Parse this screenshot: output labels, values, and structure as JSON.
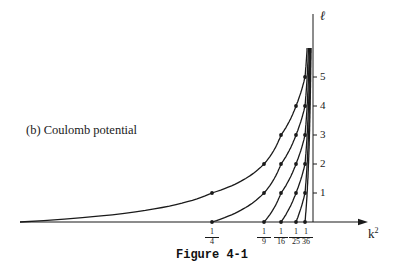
{
  "chart_data": {
    "type": "line",
    "title": "(b) Coulomb potential",
    "caption": "Figure 4-1",
    "xlabel": "k²",
    "ylabel": "ℓ",
    "x_tick_labels": [
      {
        "num": "1",
        "den": "4",
        "value": 0.25
      },
      {
        "num": "1",
        "den": "9",
        "value": 0.1111
      },
      {
        "num": "1",
        "den": "16",
        "value": 0.0625
      },
      {
        "num": "1",
        "den": "25",
        "value": 0.04
      },
      {
        "num": "1",
        "den": "36",
        "value": 0.0278
      }
    ],
    "y_tick_labels": [
      "1",
      "2",
      "3",
      "4",
      "5"
    ],
    "ylim": [
      0,
      6.5
    ],
    "grid": false,
    "note": "Each curve is a constant radial quantum number n_r; points satisfy k² = 1/(n_r + ℓ + 1)². The x-axis is drawn decreasing in k² toward the vertical ℓ axis at k² = 0.",
    "series": [
      {
        "name": "n_r = 0",
        "points": [
          {
            "k2": 0.25,
            "l": 1
          },
          {
            "k2": 0.1111,
            "l": 2
          },
          {
            "k2": 0.0625,
            "l": 3
          },
          {
            "k2": 0.04,
            "l": 4
          },
          {
            "k2": 0.0278,
            "l": 5
          }
        ]
      },
      {
        "name": "n_r = 1",
        "points": [
          {
            "k2": 0.25,
            "l": 0
          },
          {
            "k2": 0.1111,
            "l": 1
          },
          {
            "k2": 0.0625,
            "l": 2
          },
          {
            "k2": 0.04,
            "l": 3
          },
          {
            "k2": 0.0278,
            "l": 4
          }
        ]
      },
      {
        "name": "n_r = 2",
        "points": [
          {
            "k2": 0.1111,
            "l": 0
          },
          {
            "k2": 0.0625,
            "l": 1
          },
          {
            "k2": 0.04,
            "l": 2
          },
          {
            "k2": 0.0278,
            "l": 3
          }
        ]
      },
      {
        "name": "n_r = 3",
        "points": [
          {
            "k2": 0.0625,
            "l": 0
          },
          {
            "k2": 0.04,
            "l": 1
          },
          {
            "k2": 0.0278,
            "l": 2
          }
        ]
      },
      {
        "name": "n_r = 4",
        "points": [
          {
            "k2": 0.04,
            "l": 0
          },
          {
            "k2": 0.0278,
            "l": 1
          }
        ]
      },
      {
        "name": "n_r = 5",
        "points": [
          {
            "k2": 0.0278,
            "l": 0
          }
        ]
      }
    ]
  },
  "labels": {
    "panel": "(b)  Coulomb potential",
    "x_axis": "k",
    "x_axis_sup": "2",
    "y_axis": "ℓ",
    "caption": "Figure 4-1"
  }
}
